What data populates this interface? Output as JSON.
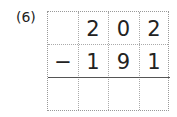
{
  "problem": {
    "label": "(6)",
    "operator": "−",
    "minuend": [
      "",
      "2",
      "0",
      "2"
    ],
    "subtrahend": [
      "−",
      "1",
      "9",
      "1"
    ],
    "answer": [
      "",
      "",
      "",
      ""
    ]
  }
}
